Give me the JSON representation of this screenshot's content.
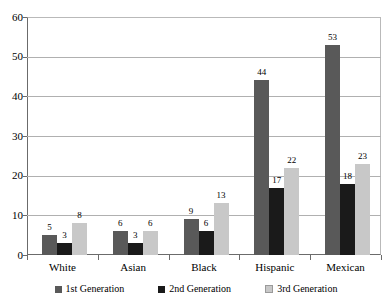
{
  "chart_data": {
    "type": "bar",
    "title": "",
    "xlabel": "",
    "ylabel": "",
    "ylim": [
      0,
      60
    ],
    "yticks": [
      0,
      10,
      20,
      30,
      40,
      50,
      60
    ],
    "grid": true,
    "legend_position": "bottom",
    "categories": [
      "White",
      "Asian",
      "Black",
      "Hispanic",
      "Mexican"
    ],
    "series": [
      {
        "name": "1st Generation",
        "color": "#595959",
        "values": [
          5,
          6,
          9,
          44,
          53
        ]
      },
      {
        "name": "2nd Generation",
        "color": "#1a1a1a",
        "values": [
          3,
          3,
          6,
          17,
          18
        ]
      },
      {
        "name": "3rd Generation",
        "color": "#c8c8c8",
        "values": [
          8,
          6,
          13,
          22,
          23
        ]
      }
    ]
  }
}
